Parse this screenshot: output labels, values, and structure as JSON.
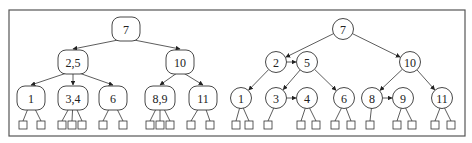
{
  "figure": {
    "frame": {
      "x": 9,
      "y": 10,
      "w": 456,
      "h": 126
    }
  },
  "left_tree": {
    "type": "2-3-4 tree",
    "nodes": [
      {
        "id": "L7",
        "label": "7",
        "x": 126,
        "y": 29,
        "w": 28,
        "leaves": []
      },
      {
        "id": "L25",
        "label": "2,5",
        "x": 73,
        "y": 62,
        "w": 30,
        "leaves": []
      },
      {
        "id": "L10",
        "label": "10",
        "x": 180,
        "y": 62,
        "w": 28,
        "leaves": []
      },
      {
        "id": "L1",
        "label": "1",
        "x": 31,
        "y": 98,
        "w": 28,
        "leaves": [
          23,
          41
        ]
      },
      {
        "id": "L34",
        "label": "3,4",
        "x": 73,
        "y": 98,
        "w": 30,
        "leaves": [
          62,
          72,
          82
        ]
      },
      {
        "id": "L6",
        "label": "6",
        "x": 113,
        "y": 98,
        "w": 28,
        "leaves": [
          103,
          123
        ]
      },
      {
        "id": "L89",
        "label": "8,9",
        "x": 160,
        "y": 98,
        "w": 30,
        "leaves": [
          150,
          160,
          170
        ]
      },
      {
        "id": "L11",
        "label": "11",
        "x": 203,
        "y": 98,
        "w": 28,
        "leaves": [
          191,
          210
        ]
      }
    ],
    "edges": [
      [
        "L7",
        "L25"
      ],
      [
        "L7",
        "L10"
      ],
      [
        "L25",
        "L1"
      ],
      [
        "L25",
        "L34"
      ],
      [
        "L25",
        "L6"
      ],
      [
        "L10",
        "L89"
      ],
      [
        "L10",
        "L11"
      ]
    ]
  },
  "right_tree": {
    "type": "binary tree with horizontal links",
    "nodes": [
      {
        "id": "R7",
        "label": "7",
        "x": 343,
        "y": 29,
        "leaves": []
      },
      {
        "id": "R2",
        "label": "2",
        "x": 276,
        "y": 62,
        "leaves": []
      },
      {
        "id": "R5",
        "label": "5",
        "x": 307,
        "y": 62,
        "leaves": []
      },
      {
        "id": "R10",
        "label": "10",
        "x": 410,
        "y": 62,
        "leaves": []
      },
      {
        "id": "R1",
        "label": "1",
        "x": 241,
        "y": 98,
        "leaves": [
          236,
          249
        ]
      },
      {
        "id": "R3",
        "label": "3",
        "x": 276,
        "y": 98,
        "leaves": [
          268
        ]
      },
      {
        "id": "R4",
        "label": "4",
        "x": 307,
        "y": 98,
        "leaves": [
          301,
          316
        ]
      },
      {
        "id": "R6",
        "label": "6",
        "x": 344,
        "y": 98,
        "leaves": [
          335,
          351
        ]
      },
      {
        "id": "R8",
        "label": "8",
        "x": 372,
        "y": 98,
        "leaves": [
          370
        ]
      },
      {
        "id": "R9",
        "label": "9",
        "x": 403,
        "y": 98,
        "leaves": [
          397,
          412
        ]
      },
      {
        "id": "R11",
        "label": "11",
        "x": 442,
        "y": 98,
        "leaves": [
          435,
          451
        ]
      }
    ],
    "edges": [
      [
        "R7",
        "R2"
      ],
      [
        "R7",
        "R10"
      ],
      [
        "R2",
        "R1"
      ],
      [
        "R5",
        "R3"
      ],
      [
        "R5",
        "R6"
      ],
      [
        "R10",
        "R8"
      ],
      [
        "R10",
        "R11"
      ]
    ],
    "horizontal_edges": [
      [
        "R2",
        "R5"
      ],
      [
        "R3",
        "R4"
      ],
      [
        "R8",
        "R9"
      ]
    ]
  }
}
